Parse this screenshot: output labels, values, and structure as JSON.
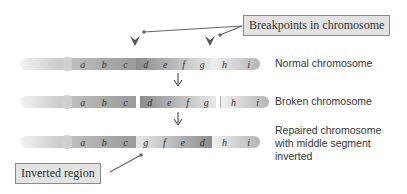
{
  "callouts": {
    "breakpoints": "Breakpoints in chromosome",
    "inverted": "Inverted region"
  },
  "rows": [
    {
      "label": "Normal chromosome",
      "left": [
        "a",
        "b",
        "c"
      ],
      "middle": [
        "d",
        "e",
        "f",
        "g"
      ],
      "right": [
        "h",
        "i"
      ]
    },
    {
      "label": "Broken chromosome",
      "left": [
        "a",
        "b",
        "c"
      ],
      "middle": [
        "d",
        "e",
        "f",
        "g"
      ],
      "right": [
        "h",
        "i"
      ]
    },
    {
      "label": "Repaired chromosome with middle segment inverted",
      "left": [
        "a",
        "b",
        "c"
      ],
      "middle": [
        "g",
        "f",
        "e",
        "d"
      ],
      "right": [
        "h",
        "i"
      ]
    }
  ],
  "labels": {
    "row1": "Normal chromosome",
    "row2": "Broken chromosome",
    "row3_line1": "Repaired chromosome",
    "row3_line2": "with middle segment",
    "row3_line3": "inverted"
  },
  "colors": {
    "dark": "#8c8c8c",
    "light": "#efefef",
    "box_fill": "#e3e3e3"
  }
}
